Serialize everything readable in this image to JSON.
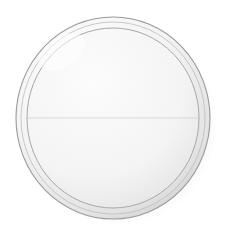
{
  "figure": {
    "style": "grayscale pen-and-wash scientific illustration",
    "background_color": "#ffffff"
  },
  "canvas": {
    "width": 227,
    "height": 237
  },
  "colors": {
    "background": "#ffffff",
    "membrane_stroke": "#9a9a9a",
    "membrane_fill": "#efefef",
    "cytoplasm_fill": "#f4f4f4",
    "inner_sphere_stroke": "#a8a8a8",
    "spindle_fiber": "#707070",
    "astral_ray": "#6a6a6a",
    "chromosome_fill": "#8e8e8e",
    "chromosome_stroke": "#5d5d5d",
    "chromosome_highlight": "#c9c9c9",
    "centromere": "#4a4a4a",
    "centrosome_fill": "#5e5e5e",
    "centrosome_stroke": "#3c3c3c",
    "shadow": "#d9d9d9"
  },
  "cell": {
    "label": "cell",
    "center_x": 113,
    "center_y": 118,
    "membrane_radius_x": 97,
    "membrane_radius_y": 101,
    "inner_sphere_radius_x": 86,
    "inner_sphere_radius_y": 90
  },
  "shadow": {
    "label": "drop-shadow",
    "offset_x": 7,
    "offset_y": 6,
    "opacity": 0.45
  },
  "poles": [
    {
      "label": "top centrosome",
      "name": "centrosome-top",
      "x": 112,
      "y": 45,
      "barrel_width": 15,
      "barrel_height": 9,
      "orientation": "horizontal"
    },
    {
      "label": "bottom centrosome",
      "name": "centrosome-bottom",
      "x": 112,
      "y": 192,
      "barrel_width": 15,
      "barrel_height": 9,
      "orientation": "horizontal"
    }
  ],
  "spindle": {
    "label": "mitotic spindle",
    "meridian_count": 13,
    "meridian_max_half_width": 86,
    "astral_rays_per_pole": 17,
    "astral_ray_length": 26,
    "astral_fan_degrees": 200
  },
  "metaphase_plate": {
    "label": "metaphase plate",
    "y": 118,
    "chromosome_count": 4
  },
  "chromosomes": [
    {
      "label": "chromosome 1",
      "name": "chromosome-left-outer",
      "cx": 42,
      "cy": 118,
      "length": 46,
      "thickness": 19,
      "centromere_side": "right",
      "centromere_x": 67
    },
    {
      "label": "chromosome 2",
      "name": "chromosome-left-inner",
      "cx": 87,
      "cy": 118,
      "length": 34,
      "thickness": 17,
      "centromere_side": "left",
      "centromere_x": 67
    },
    {
      "label": "chromosome 3",
      "name": "chromosome-center",
      "cx": 128,
      "cy": 118,
      "length": 56,
      "thickness": 22,
      "centromere_side": "right",
      "centromere_x": 159
    },
    {
      "label": "chromosome 4",
      "name": "chromosome-right-outer",
      "cx": 182,
      "cy": 118,
      "length": 42,
      "thickness": 19,
      "centromere_side": "left",
      "centromere_x": 159
    }
  ],
  "centromeres": [
    {
      "label": "centromere 1",
      "x": 67,
      "y": 118,
      "width": 7,
      "height": 8
    },
    {
      "label": "centromere 2",
      "x": 159,
      "y": 118,
      "width": 7,
      "height": 8
    }
  ]
}
